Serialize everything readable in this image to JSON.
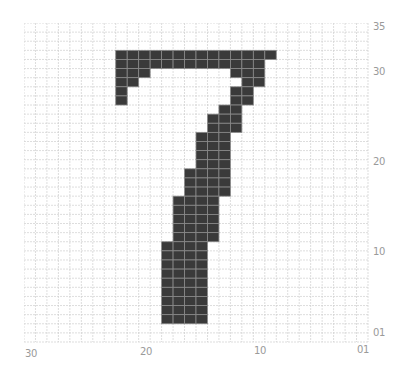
{
  "figure": {
    "digit": "7",
    "grid": {
      "cols": 30,
      "rows": 35
    },
    "colors": {
      "filled": "#3a3a3a",
      "filled_line": "#8a8a8a",
      "grid_line": "#cfcfcf",
      "background": "#ffffff",
      "label": "#9a9a9a"
    },
    "x_axis": {
      "ticks": [
        {
          "label": "30",
          "x": 31,
          "y": 354
        },
        {
          "label": "20",
          "x": 146,
          "y": 352
        },
        {
          "label": "10",
          "x": 260,
          "y": 351
        },
        {
          "label": "01",
          "x": 363,
          "y": 350
        }
      ]
    },
    "y_axis": {
      "ticks": [
        {
          "label": "35",
          "x": 379,
          "y": 27
        },
        {
          "label": "30",
          "x": 379,
          "y": 72
        },
        {
          "label": "20",
          "x": 379,
          "y": 162
        },
        {
          "label": "10",
          "x": 379,
          "y": 252
        },
        {
          "label": "01",
          "x": 379,
          "y": 333
        }
      ]
    },
    "filled_runs": [
      {
        "row": 3,
        "from": 8,
        "to": 21
      },
      {
        "row": 4,
        "from": 8,
        "to": 20
      },
      {
        "row": 5,
        "from": 8,
        "to": 10
      },
      {
        "row": 5,
        "from": 18,
        "to": 20
      },
      {
        "row": 6,
        "from": 8,
        "to": 9
      },
      {
        "row": 6,
        "from": 19,
        "to": 20
      },
      {
        "row": 7,
        "from": 8,
        "to": 8
      },
      {
        "row": 7,
        "from": 18,
        "to": 19
      },
      {
        "row": 8,
        "from": 8,
        "to": 8
      },
      {
        "row": 8,
        "from": 18,
        "to": 19
      },
      {
        "row": 9,
        "from": 17,
        "to": 18
      },
      {
        "row": 10,
        "from": 16,
        "to": 18
      },
      {
        "row": 11,
        "from": 16,
        "to": 18
      },
      {
        "row": 12,
        "from": 15,
        "to": 17
      },
      {
        "row": 13,
        "from": 15,
        "to": 17
      },
      {
        "row": 14,
        "from": 15,
        "to": 17
      },
      {
        "row": 15,
        "from": 15,
        "to": 17
      },
      {
        "row": 16,
        "from": 14,
        "to": 17
      },
      {
        "row": 17,
        "from": 14,
        "to": 17
      },
      {
        "row": 18,
        "from": 14,
        "to": 17
      },
      {
        "row": 19,
        "from": 13,
        "to": 16
      },
      {
        "row": 20,
        "from": 13,
        "to": 16
      },
      {
        "row": 21,
        "from": 13,
        "to": 16
      },
      {
        "row": 22,
        "from": 13,
        "to": 16
      },
      {
        "row": 23,
        "from": 13,
        "to": 16
      },
      {
        "row": 24,
        "from": 12,
        "to": 15
      },
      {
        "row": 25,
        "from": 12,
        "to": 15
      },
      {
        "row": 26,
        "from": 12,
        "to": 15
      },
      {
        "row": 27,
        "from": 12,
        "to": 15
      },
      {
        "row": 28,
        "from": 12,
        "to": 15
      },
      {
        "row": 29,
        "from": 12,
        "to": 15
      },
      {
        "row": 30,
        "from": 12,
        "to": 15
      },
      {
        "row": 31,
        "from": 12,
        "to": 15
      },
      {
        "row": 32,
        "from": 12,
        "to": 15
      }
    ]
  }
}
